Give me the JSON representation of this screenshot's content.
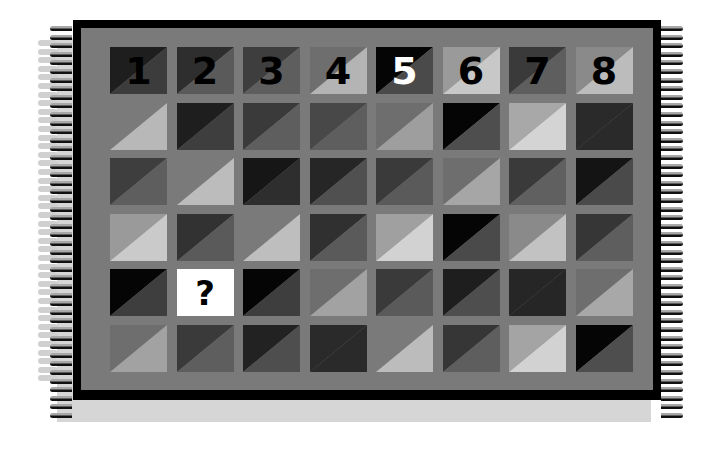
{
  "puzzle": {
    "title": "",
    "columns": [
      "1",
      "2",
      "3",
      "4",
      "5",
      "6",
      "7",
      "8"
    ],
    "question_mark": "?",
    "question_position": {
      "row": 4,
      "col": 2
    },
    "background_color": "#7a7a7a",
    "frame_color": "#000000",
    "rows": [
      [
        {
          "label": "1",
          "ul": "#1e1e1e",
          "lr": "#3c3c3c",
          "label_color": "#000000"
        },
        {
          "label": "2",
          "ul": "#2e2e2e",
          "lr": "#5a5a5a",
          "label_color": "#000000"
        },
        {
          "label": "3",
          "ul": "#3e3e3e",
          "lr": "#5e5e5e",
          "label_color": "#000000"
        },
        {
          "label": "4",
          "ul": "#6e6e6e",
          "lr": "#b4b4b4",
          "label_color": "#000000"
        },
        {
          "label": "5",
          "ul": "#050505",
          "lr": "#4a4a4a",
          "label_color": "#ffffff"
        },
        {
          "label": "6",
          "ul": "#9a9a9a",
          "lr": "#c8c8c8",
          "label_color": "#000000"
        },
        {
          "label": "7",
          "ul": "#3a3a3a",
          "lr": "#5e5e5e",
          "label_color": "#000000"
        },
        {
          "label": "8",
          "ul": "#8a8a8a",
          "lr": "#bcbcbc",
          "label_color": "#000000"
        }
      ],
      [
        {
          "ul": "#7a7a7a",
          "lr": "#b8b8b8"
        },
        {
          "ul": "#1e1e1e",
          "lr": "#3e3e3e"
        },
        {
          "ul": "#3a3a3a",
          "lr": "#5e5e5e"
        },
        {
          "ul": "#484848",
          "lr": "#5e5e5e"
        },
        {
          "ul": "#6e6e6e",
          "lr": "#9e9e9e"
        },
        {
          "ul": "#050505",
          "lr": "#4e4e4e"
        },
        {
          "ul": "#a8a8a8",
          "lr": "#d4d4d4"
        },
        {
          "ul": "#2a2a2a",
          "lr": "#2a2a2a"
        }
      ],
      [
        {
          "ul": "#3e3e3e",
          "lr": "#5e5e5e"
        },
        {
          "ul": "#7a7a7a",
          "lr": "#bcbcbc"
        },
        {
          "ul": "#161616",
          "lr": "#2e2e2e"
        },
        {
          "ul": "#262626",
          "lr": "#505050"
        },
        {
          "ul": "#3a3a3a",
          "lr": "#5a5a5a"
        },
        {
          "ul": "#6e6e6e",
          "lr": "#a6a6a6"
        },
        {
          "ul": "#3a3a3a",
          "lr": "#606060"
        },
        {
          "ul": "#141414",
          "lr": "#4a4a4a"
        }
      ],
      [
        {
          "ul": "#9a9a9a",
          "lr": "#cacaca"
        },
        {
          "ul": "#323232",
          "lr": "#5a5a5a"
        },
        {
          "ul": "#7a7a7a",
          "lr": "#bebebe"
        },
        {
          "ul": "#303030",
          "lr": "#5a5a5a"
        },
        {
          "ul": "#a0a0a0",
          "lr": "#d2d2d2"
        },
        {
          "ul": "#050505",
          "lr": "#4a4a4a"
        },
        {
          "ul": "#8a8a8a",
          "lr": "#c2c2c2"
        },
        {
          "ul": "#363636",
          "lr": "#5e5e5e"
        }
      ],
      [
        {
          "ul": "#050505",
          "lr": "#3e3e3e"
        },
        {
          "question": true,
          "label": "?",
          "ul": "#ffffff",
          "lr": "#ffffff",
          "label_color": "#000000"
        },
        {
          "ul": "#050505",
          "lr": "#3e3e3e"
        },
        {
          "ul": "#6e6e6e",
          "lr": "#a2a2a2"
        },
        {
          "ul": "#3a3a3a",
          "lr": "#5a5a5a"
        },
        {
          "ul": "#1e1e1e",
          "lr": "#4e4e4e"
        },
        {
          "ul": "#262626",
          "lr": "#262626"
        },
        {
          "ul": "#6e6e6e",
          "lr": "#a8a8a8"
        }
      ],
      [
        {
          "ul": "#6e6e6e",
          "lr": "#a2a2a2"
        },
        {
          "ul": "#3a3a3a",
          "lr": "#5e5e5e"
        },
        {
          "ul": "#222222",
          "lr": "#4e4e4e"
        },
        {
          "ul": "#2a2a2a",
          "lr": "#2a2a2a"
        },
        {
          "ul": "#7a7a7a",
          "lr": "#bcbcbc"
        },
        {
          "ul": "#363636",
          "lr": "#5e5e5e"
        },
        {
          "ul": "#a4a4a4",
          "lr": "#d2d2d2"
        },
        {
          "ul": "#050505",
          "lr": "#4e4e4e"
        }
      ]
    ]
  }
}
